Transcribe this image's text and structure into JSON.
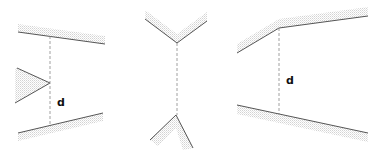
{
  "diagram": {
    "panels": [
      {
        "id": "panel-1",
        "description": "Flat surfaces with wedge protrusion",
        "label": "d"
      },
      {
        "id": "panel-2",
        "description": "Opposing V-shaped wedges",
        "label": ""
      },
      {
        "id": "panel-3",
        "description": "Angled surfaces with kink",
        "label": "d"
      }
    ],
    "colors": {
      "line": "#555555",
      "hatch": "#d6d6d6",
      "dash": "#888888"
    }
  }
}
